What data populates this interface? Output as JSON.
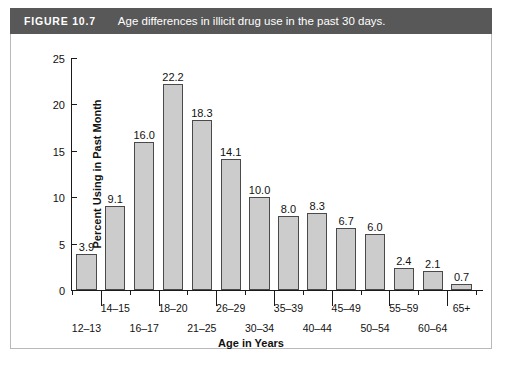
{
  "figure": {
    "number_label": "FIGURE 10.7",
    "caption": "Age differences in illicit drug use in the past 30 days."
  },
  "colors": {
    "banner_background": "#585858",
    "banner_text": "#ffffff",
    "bar_fill": "#cccccc",
    "bar_border": "#4a4a4a",
    "axis": "#1a1a1a",
    "card_border": "#b9b9b9",
    "page_background": "#ffffff"
  },
  "chart_data": {
    "type": "bar",
    "title": "Age differences in illicit drug use in the past 30 days.",
    "xlabel": "Age in Years",
    "ylabel": "Percent Using in Past Month",
    "ylim": [
      0,
      25
    ],
    "yticks": [
      "0",
      "5",
      "10",
      "15",
      "20",
      "25"
    ],
    "grid": false,
    "legend": "none",
    "categories": [
      "12–13",
      "14–15",
      "16–17",
      "18–20",
      "21–25",
      "26–29",
      "30–34",
      "35–39",
      "40–44",
      "45–49",
      "50–54",
      "55–59",
      "60–64",
      "65+"
    ],
    "values": [
      3.9,
      9.1,
      16.0,
      22.2,
      18.3,
      14.1,
      10.0,
      8.0,
      8.3,
      6.7,
      6.0,
      2.4,
      2.1,
      0.7
    ],
    "data_labels": [
      "3.9",
      "9.1",
      "16.0",
      "22.2",
      "18.3",
      "14.1",
      "10.0",
      "8.0",
      "8.3",
      "6.7",
      "6.0",
      "2.4",
      "2.1",
      "0.7"
    ],
    "tick_label_rows": [
      1,
      0,
      1,
      0,
      1,
      0,
      1,
      0,
      1,
      0,
      1,
      0,
      1,
      0
    ]
  }
}
